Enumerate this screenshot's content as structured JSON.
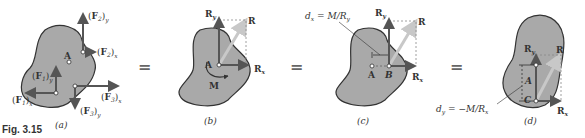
{
  "figure": {
    "caption": "Fig. 3.15",
    "panels": [
      {
        "id": "a",
        "label": "(a)",
        "point": "A",
        "forces": [
          "(F1)x",
          "(F1)y",
          "(F2)x",
          "(F2)y",
          "(F3)x",
          "(F3)y"
        ]
      },
      {
        "id": "b",
        "label": "(b)",
        "point": "A",
        "vectors": [
          "Ry",
          "R",
          "Rx"
        ],
        "moment": "M"
      },
      {
        "id": "c",
        "label": "(c)",
        "points": [
          "A",
          "B"
        ],
        "vectors": [
          "Ry",
          "R",
          "Rx"
        ],
        "annotation": "dx = M/Ry"
      },
      {
        "id": "d",
        "label": "(d)",
        "points": [
          "A",
          "C"
        ],
        "vectors": [
          "Ry",
          "R",
          "Rx"
        ],
        "annotation": "dy = −M/Rx"
      }
    ],
    "equals_signs": [
      "=",
      "=",
      "="
    ],
    "colors": {
      "body_fill": "#a9a9a9",
      "body_outline": "#333333",
      "vector_dark": "#555555",
      "vector_light": "#c8c8c8"
    }
  },
  "labels": {
    "caption": "Fig. 3.15",
    "a": "(a)",
    "b": "(b)",
    "c": "(c)",
    "d": "(d)",
    "eq": "="
  }
}
